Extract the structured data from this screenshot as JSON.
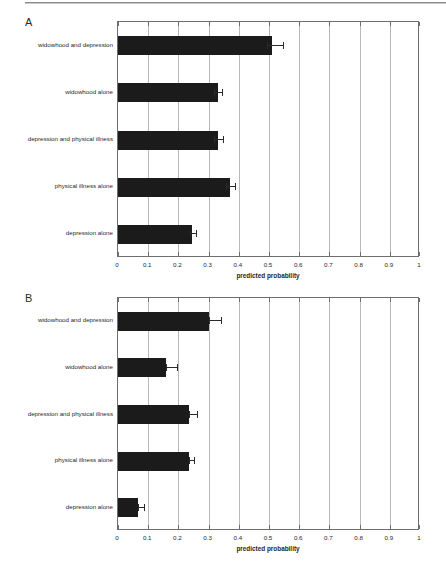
{
  "figure": {
    "top_rule": true,
    "background": "#ffffff",
    "bar_color": "#1b1b1b",
    "grid_color": "#b9b9b9",
    "axis_color": "#6e6e6e"
  },
  "panels": [
    {
      "letter": "A",
      "axis_title": "predicted probability",
      "ticks": [
        "0",
        "0.1",
        "0.2",
        "0.3",
        "0.4",
        "0.5",
        "0.6",
        "0.7",
        "0.8",
        "0.9",
        "1"
      ],
      "categories": [
        "widowhood and depression",
        "widowhood alone",
        "depression and physical illness",
        "physical illness alone",
        "depression alone"
      ],
      "values": [
        0.51,
        0.33,
        0.33,
        0.37,
        0.245
      ],
      "ci_low": [
        0.492,
        0.318,
        0.318,
        0.356,
        0.238
      ],
      "ci_high": [
        0.545,
        0.345,
        0.348,
        0.387,
        0.258
      ]
    },
    {
      "letter": "B",
      "axis_title": "predicted probability",
      "ticks": [
        "0",
        "0.1",
        "0.2",
        "0.3",
        "0.4",
        "0.5",
        "0.6",
        "0.7",
        "0.8",
        "0.9",
        "1"
      ],
      "categories": [
        "widowhood and depression",
        "widowhood alone",
        "depression and physical illness",
        "physical illness alone",
        "depression alone"
      ],
      "values": [
        0.3,
        0.16,
        0.235,
        0.235,
        0.065
      ],
      "ci_low": [
        0.3,
        0.16,
        0.235,
        0.235,
        0.065
      ],
      "ci_high": [
        0.342,
        0.197,
        0.262,
        0.253,
        0.087
      ]
    }
  ],
  "chart_data": {
    "type": "bar",
    "orientation": "horizontal",
    "title": "",
    "xlabel": "predicted probability",
    "ylabel": "",
    "xlim": [
      0,
      1
    ],
    "xticks": [
      0,
      0.1,
      0.2,
      0.3,
      0.4,
      0.5,
      0.6,
      0.7,
      0.8,
      0.9,
      1
    ],
    "grid": "vertical",
    "legend": "none",
    "panels": [
      {
        "panel": "A",
        "categories": [
          "widowhood and depression",
          "widowhood alone",
          "depression and physical illness",
          "physical illness alone",
          "depression alone"
        ],
        "values": [
          0.51,
          0.33,
          0.33,
          0.37,
          0.245
        ],
        "error_low": [
          0.492,
          0.318,
          0.318,
          0.356,
          0.238
        ],
        "error_high": [
          0.545,
          0.345,
          0.348,
          0.387,
          0.258
        ]
      },
      {
        "panel": "B",
        "categories": [
          "widowhood and depression",
          "widowhood alone",
          "depression and physical illness",
          "physical illness alone",
          "depression alone"
        ],
        "values": [
          0.3,
          0.16,
          0.235,
          0.235,
          0.065
        ],
        "error_low": [
          0.3,
          0.16,
          0.235,
          0.235,
          0.065
        ],
        "error_high": [
          0.342,
          0.197,
          0.262,
          0.253,
          0.087
        ]
      }
    ]
  }
}
